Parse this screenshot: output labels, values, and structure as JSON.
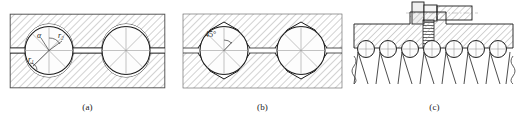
{
  "figure": {
    "background_color": "#ffffff",
    "line_color": "#1a1a1a",
    "hatch_color": "#8a8a8a",
    "ball_fill": "#fdfdfd",
    "panels": [
      {
        "id": "a",
        "caption": "(a)",
        "description": "circular-arc raceway groove with two balls in a nut-screw cross section",
        "labels": [
          {
            "name": "alpha",
            "text": "α"
          },
          {
            "name": "r-two",
            "text": "r₂"
          },
          {
            "name": "r-one",
            "text": "r₁"
          }
        ],
        "ball_count": 2
      },
      {
        "id": "b",
        "caption": "(b)",
        "description": "gothic-arch raceway groove with 45 degree contact angle and two balls",
        "labels": [
          {
            "name": "contact-angle",
            "text": "45°"
          }
        ],
        "ball_count": 2
      },
      {
        "id": "c",
        "caption": "(c)",
        "description": "ball screw assembly cross section with bolt, threaded shaft and row of balls over slanted thread flanks",
        "labels": [],
        "ball_count": 7
      }
    ]
  }
}
